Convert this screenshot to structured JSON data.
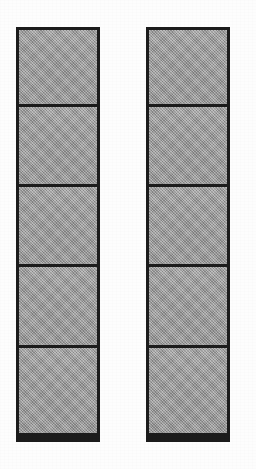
{
  "figure": {
    "canvas": {
      "width": 256,
      "height": 469,
      "background_color": "#fdfdfd"
    },
    "style": {
      "fill_color": "#9b9b9b",
      "stroke_color": "#1c1c1c",
      "outer_stroke_width": 3,
      "divider_stroke_width": 3,
      "fill_pattern": "halftone-dither"
    },
    "columns": [
      {
        "name": "left-column",
        "label": "Left column",
        "x": 16,
        "y": 27,
        "width": 84,
        "height": 415,
        "segment_count": 5,
        "segments": [
          {
            "index": 1,
            "label": "Segment 1",
            "height": 74
          },
          {
            "index": 2,
            "label": "Segment 2",
            "height": 80
          },
          {
            "index": 3,
            "label": "Segment 3",
            "height": 80
          },
          {
            "index": 4,
            "label": "Segment 4",
            "height": 81
          },
          {
            "index": 5,
            "label": "Segment 5",
            "height": 88
          }
        ]
      },
      {
        "name": "right-column",
        "label": "Right column",
        "x": 146,
        "y": 27,
        "width": 84,
        "height": 415,
        "segment_count": 5,
        "segments": [
          {
            "index": 1,
            "label": "Segment 1",
            "height": 74
          },
          {
            "index": 2,
            "label": "Segment 2",
            "height": 80
          },
          {
            "index": 3,
            "label": "Segment 3",
            "height": 80
          },
          {
            "index": 4,
            "label": "Segment 4",
            "height": 81
          },
          {
            "index": 5,
            "label": "Segment 5",
            "height": 88
          }
        ]
      }
    ]
  }
}
